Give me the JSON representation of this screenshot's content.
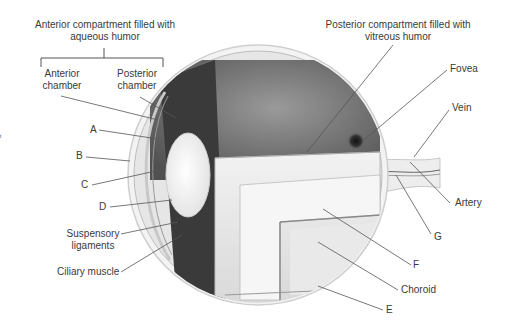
{
  "diagram": {
    "labels": {
      "anterior_compartment": "Anterior compartment filled with aqueous humor",
      "anterior_compartment_line1": "Anterior compartment filled with",
      "anterior_compartment_line2": "aqueous humor",
      "anterior_chamber_line1": "Anterior",
      "anterior_chamber_line2": "chamber",
      "posterior_chamber_line1": "Posterior",
      "posterior_chamber_line2": "chamber",
      "posterior_compartment_line1": "Posterior compartment filled with",
      "posterior_compartment_line2": "vitreous humor",
      "fovea": "Fovea",
      "vein": "Vein",
      "artery": "Artery",
      "a": "A",
      "b": "B",
      "c": "C",
      "d": "D",
      "e": "E",
      "f": "F",
      "g": "G",
      "suspensory_line1": "Suspensory",
      "suspensory_line2": "ligaments",
      "ciliary_muscle": "Ciliary muscle",
      "choroid": "Choroid"
    },
    "copyright": "© Jones & Bartlett Learning."
  }
}
